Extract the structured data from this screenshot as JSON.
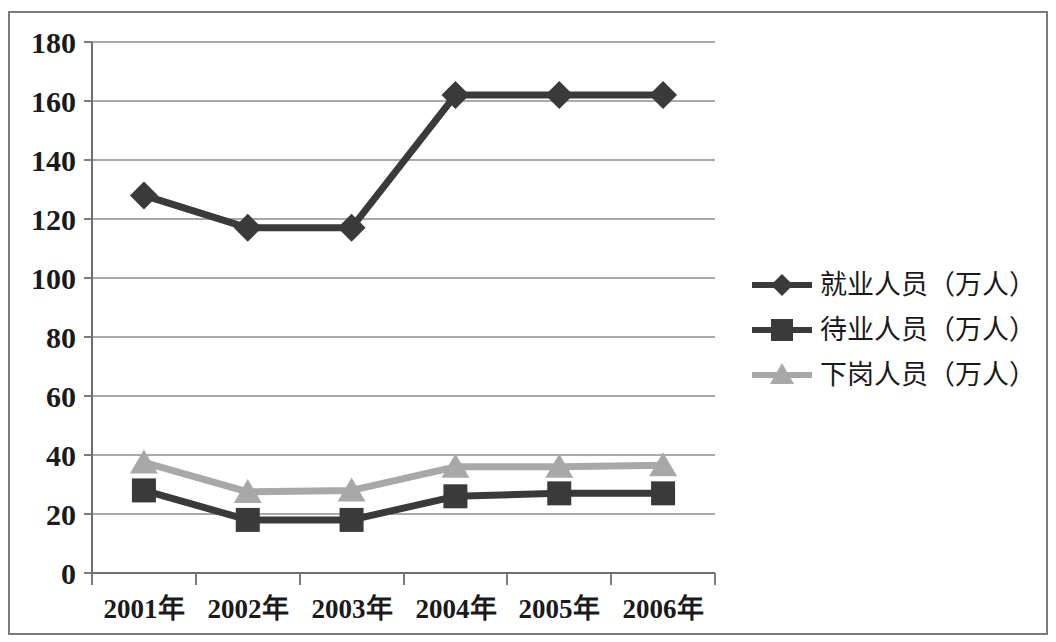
{
  "chart_data": {
    "type": "line",
    "title": "",
    "xlabel": "",
    "ylabel": "",
    "categories": [
      "2001年",
      "2002年",
      "2003年",
      "2004年",
      "2005年",
      "2006年"
    ],
    "ylim": [
      0,
      180
    ],
    "yticks": [
      0,
      20,
      40,
      60,
      80,
      100,
      120,
      140,
      160,
      180
    ],
    "ytick_labels": [
      "0",
      "20",
      "40",
      "60",
      "80",
      "100",
      "120",
      "140",
      "160",
      "180"
    ],
    "grid": true,
    "legend_position": "right",
    "series": [
      {
        "name": "就业人员（万人）",
        "marker": "diamond",
        "color": "#3a3a3a",
        "values": [
          128,
          117,
          117,
          162,
          162,
          162
        ]
      },
      {
        "name": "待业人员（万人）",
        "marker": "square",
        "color": "#3a3a3a",
        "values": [
          28,
          18,
          18,
          26,
          27,
          27
        ]
      },
      {
        "name": "下岗人员（万人）",
        "marker": "triangle",
        "color": "#a8a8a8",
        "values": [
          37.5,
          27.5,
          28,
          36,
          36,
          36.5
        ]
      }
    ]
  },
  "axis": {
    "y_labels": [
      "180",
      "160",
      "140",
      "120",
      "100",
      "80",
      "60",
      "40",
      "20",
      "0"
    ],
    "x_labels": [
      "2001年",
      "2002年",
      "2003年",
      "2004年",
      "2005年",
      "2006年"
    ]
  },
  "legend": {
    "items": [
      {
        "label": "就业人员（万人）",
        "marker": "diamond-marker",
        "color": "#3a3a3a"
      },
      {
        "label": "待业人员（万人）",
        "marker": "square-marker",
        "color": "#3a3a3a"
      },
      {
        "label": "下岗人员（万人）",
        "marker": "triangle-marker",
        "color": "#a8a8a8"
      }
    ]
  },
  "colors": {
    "series_dark": "#3a3a3a",
    "series_light": "#a8a8a8",
    "grid": "#8c8c8c",
    "frame": "#7a7a7a",
    "text": "#1a1a1a",
    "background": "#ffffff"
  }
}
